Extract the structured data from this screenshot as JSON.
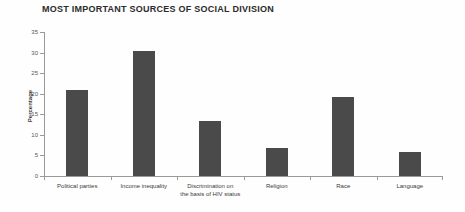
{
  "chart_data": {
    "type": "bar",
    "title": "MOST IMPORTANT SOURCES OF SOCIAL DIVISION",
    "xlabel": "",
    "ylabel": "Percentage",
    "ylim": [
      0,
      35
    ],
    "yticks": [
      0,
      5,
      10,
      15,
      20,
      25,
      30,
      35
    ],
    "grid": false,
    "legend": null,
    "bar_color": "#4a4a4a",
    "categories": [
      "Political parties",
      "Income inequality",
      "Discrimination on\nthe basis of HIV status",
      "Religion",
      "Race",
      "Language"
    ],
    "values": [
      21.0,
      30.5,
      13.4,
      6.7,
      19.3,
      5.8
    ]
  }
}
